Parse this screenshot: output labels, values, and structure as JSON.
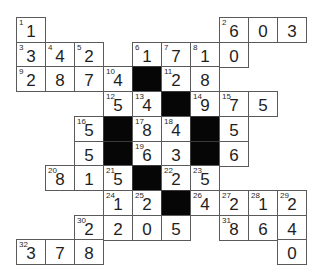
{
  "puzzle": {
    "type": "cross-number",
    "cols": 10,
    "rows": 10,
    "colors": {
      "cell_bg": "#ffffff",
      "block": "#060606",
      "border": "#5a5a5a",
      "text": "#1e1e1e"
    },
    "cells": [
      {
        "r": 0,
        "c": 0,
        "num": "1",
        "val": "1"
      },
      {
        "r": 0,
        "c": 7,
        "num": "2",
        "val": "6"
      },
      {
        "r": 0,
        "c": 8,
        "num": "",
        "val": "0"
      },
      {
        "r": 0,
        "c": 9,
        "num": "",
        "val": "3"
      },
      {
        "r": 1,
        "c": 0,
        "num": "3",
        "val": "3"
      },
      {
        "r": 1,
        "c": 1,
        "num": "4",
        "val": "4"
      },
      {
        "r": 1,
        "c": 2,
        "num": "5",
        "val": "2"
      },
      {
        "r": 1,
        "c": 4,
        "num": "6",
        "val": "1"
      },
      {
        "r": 1,
        "c": 5,
        "num": "7",
        "val": "7"
      },
      {
        "r": 1,
        "c": 6,
        "num": "8",
        "val": "1"
      },
      {
        "r": 1,
        "c": 7,
        "num": "",
        "val": "0"
      },
      {
        "r": 2,
        "c": 0,
        "num": "9",
        "val": "2"
      },
      {
        "r": 2,
        "c": 1,
        "num": "",
        "val": "8"
      },
      {
        "r": 2,
        "c": 2,
        "num": "",
        "val": "7"
      },
      {
        "r": 2,
        "c": 3,
        "num": "10",
        "val": "4"
      },
      {
        "r": 2,
        "c": 4,
        "black": true
      },
      {
        "r": 2,
        "c": 5,
        "num": "11",
        "val": "2"
      },
      {
        "r": 2,
        "c": 6,
        "num": "",
        "val": "8"
      },
      {
        "r": 3,
        "c": 3,
        "num": "12",
        "val": "5"
      },
      {
        "r": 3,
        "c": 4,
        "num": "13",
        "val": "4"
      },
      {
        "r": 3,
        "c": 5,
        "black": true
      },
      {
        "r": 3,
        "c": 6,
        "num": "14",
        "val": "9"
      },
      {
        "r": 3,
        "c": 7,
        "num": "15",
        "val": "7"
      },
      {
        "r": 3,
        "c": 8,
        "num": "",
        "val": "5"
      },
      {
        "r": 4,
        "c": 2,
        "num": "16",
        "val": "5"
      },
      {
        "r": 4,
        "c": 3,
        "black": true
      },
      {
        "r": 4,
        "c": 4,
        "num": "17",
        "val": "8"
      },
      {
        "r": 4,
        "c": 5,
        "num": "18",
        "val": "4"
      },
      {
        "r": 4,
        "c": 6,
        "black": true
      },
      {
        "r": 4,
        "c": 7,
        "num": "",
        "val": "5"
      },
      {
        "r": 5,
        "c": 2,
        "num": "",
        "val": "5"
      },
      {
        "r": 5,
        "c": 3,
        "black": true
      },
      {
        "r": 5,
        "c": 4,
        "num": "19",
        "val": "6"
      },
      {
        "r": 5,
        "c": 5,
        "num": "",
        "val": "3"
      },
      {
        "r": 5,
        "c": 6,
        "black": true
      },
      {
        "r": 5,
        "c": 7,
        "num": "",
        "val": "6"
      },
      {
        "r": 6,
        "c": 1,
        "num": "20",
        "val": "8"
      },
      {
        "r": 6,
        "c": 2,
        "num": "",
        "val": "1"
      },
      {
        "r": 6,
        "c": 3,
        "num": "21",
        "val": "5"
      },
      {
        "r": 6,
        "c": 4,
        "black": true
      },
      {
        "r": 6,
        "c": 5,
        "num": "22",
        "val": "2"
      },
      {
        "r": 6,
        "c": 6,
        "num": "23",
        "val": "5"
      },
      {
        "r": 7,
        "c": 3,
        "num": "24",
        "val": "1"
      },
      {
        "r": 7,
        "c": 4,
        "num": "25",
        "val": "2"
      },
      {
        "r": 7,
        "c": 5,
        "black": true
      },
      {
        "r": 7,
        "c": 6,
        "num": "26",
        "val": "4"
      },
      {
        "r": 7,
        "c": 7,
        "num": "27",
        "val": "2"
      },
      {
        "r": 7,
        "c": 8,
        "num": "28",
        "val": "1"
      },
      {
        "r": 7,
        "c": 9,
        "num": "29",
        "val": "2"
      },
      {
        "r": 8,
        "c": 2,
        "num": "30",
        "val": "2"
      },
      {
        "r": 8,
        "c": 3,
        "num": "",
        "val": "2"
      },
      {
        "r": 8,
        "c": 4,
        "num": "",
        "val": "0"
      },
      {
        "r": 8,
        "c": 5,
        "num": "",
        "val": "5"
      },
      {
        "r": 8,
        "c": 7,
        "num": "31",
        "val": "8"
      },
      {
        "r": 8,
        "c": 8,
        "num": "",
        "val": "6"
      },
      {
        "r": 8,
        "c": 9,
        "num": "",
        "val": "4"
      },
      {
        "r": 9,
        "c": 0,
        "num": "32",
        "val": "3"
      },
      {
        "r": 9,
        "c": 1,
        "num": "",
        "val": "7"
      },
      {
        "r": 9,
        "c": 2,
        "num": "",
        "val": "8"
      },
      {
        "r": 9,
        "c": 9,
        "num": "",
        "val": "0"
      }
    ]
  }
}
